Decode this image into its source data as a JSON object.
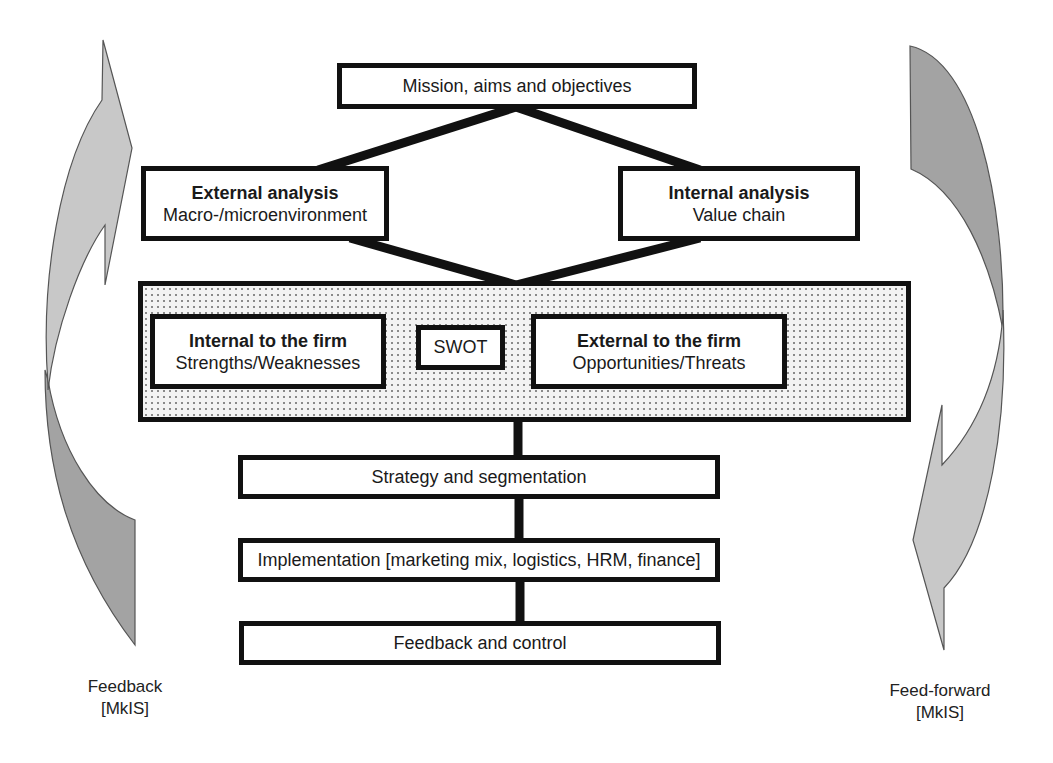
{
  "diagram": {
    "top": {
      "label": "Mission, aims and objectives"
    },
    "external_analysis": {
      "title": "External analysis",
      "subtitle": "Macro-/microenvironment"
    },
    "internal_analysis": {
      "title": "Internal analysis",
      "subtitle": "Value chain"
    },
    "swot_panel": {
      "internal": {
        "title": "Internal to the firm",
        "subtitle": "Strengths/Weaknesses"
      },
      "center": {
        "label": "SWOT"
      },
      "external": {
        "title": "External to the firm",
        "subtitle": "Opportunities/Threats"
      }
    },
    "steps": [
      {
        "label": "Strategy and segmentation"
      },
      {
        "label": "Implementation [marketing mix, logistics, HRM, finance]"
      },
      {
        "label": "Feedback and control"
      }
    ],
    "left_arrow": {
      "line1": "Feedback",
      "line2": "[MkIS]",
      "direction": "upward"
    },
    "right_arrow": {
      "line1": "Feed-forward",
      "line2": "[MkIS]",
      "direction": "downward"
    },
    "colors": {
      "light_gray_arrow": "#c8c8c8",
      "dark_gray_arrow": "#a3a3a3",
      "border": "#111111",
      "dotted_fill": "#f3f3f3"
    }
  }
}
